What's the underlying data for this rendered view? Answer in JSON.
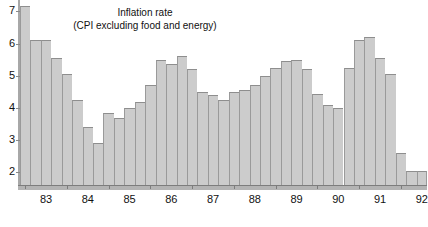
{
  "chart_data": {
    "type": "bar",
    "title": "Inflation rate",
    "subtitle": "(CPI excluding food and energy)",
    "xlabel": "",
    "ylabel": "",
    "ylim": [
      1.55,
      7.35
    ],
    "yticks": [
      2,
      3,
      4,
      5,
      6,
      7
    ],
    "ytick_labels": [
      "2",
      "3",
      "4",
      "5",
      "6",
      "7"
    ],
    "xtick_labels": [
      "83",
      "84",
      "85",
      "86",
      "87",
      "88",
      "89",
      "90",
      "91",
      "92"
    ],
    "grid": false,
    "legend": false,
    "bar_color": "#cccccc",
    "bar_edge_color": "#9a9a9a",
    "axis_color": "#7d7d7d",
    "categories": [
      "1982Q4",
      "1983Q1",
      "1983Q2",
      "1983Q3",
      "1983Q4",
      "1984Q1",
      "1984Q2",
      "1984Q3",
      "1984Q4",
      "1985Q1",
      "1985Q2",
      "1985Q3",
      "1985Q4",
      "1986Q1",
      "1986Q2",
      "1986Q3",
      "1986Q4",
      "1987Q1",
      "1987Q2",
      "1987Q3",
      "1987Q4",
      "1988Q1",
      "1988Q2",
      "1988Q3",
      "1988Q4",
      "1989Q1",
      "1989Q2",
      "1989Q3",
      "1989Q4",
      "1990Q1",
      "1990Q2",
      "1990Q3",
      "1990Q4",
      "1991Q1",
      "1991Q2",
      "1991Q3",
      "1991Q4",
      "1992Q1",
      "1992Q2"
    ],
    "values": [
      7.15,
      6.1,
      6.1,
      5.55,
      5.05,
      4.25,
      3.4,
      2.9,
      3.85,
      3.7,
      4.0,
      4.2,
      4.7,
      5.5,
      5.35,
      5.6,
      5.2,
      4.5,
      4.4,
      4.25,
      4.5,
      4.55,
      4.7,
      5.0,
      5.25,
      5.45,
      5.5,
      5.2,
      4.45,
      4.1,
      4.0,
      5.25,
      6.1,
      6.2,
      5.55,
      5.05,
      2.6,
      2.05,
      2.05
    ]
  }
}
